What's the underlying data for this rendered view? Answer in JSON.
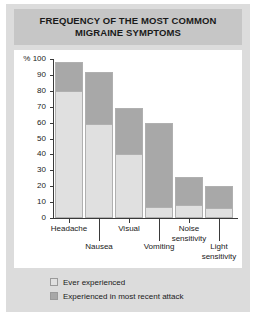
{
  "chart_data": {
    "type": "bar",
    "subtype": "stacked-bar",
    "title": "FREQUENCY OF THE MOST COMMON MIGRAINE SYMPTOMS",
    "title_lines": [
      "FREQUENCY OF THE MOST COMMON",
      "MIGRAINE SYMPTOMS"
    ],
    "xlabel": "",
    "ylabel": "%",
    "ylim": [
      0,
      100
    ],
    "yticks": [
      0,
      10,
      20,
      30,
      40,
      50,
      60,
      70,
      80,
      90,
      100
    ],
    "ytick_labels": [
      "0",
      "10",
      "20",
      "30",
      "40",
      "50",
      "60",
      "70",
      "80",
      "90",
      "100"
    ],
    "y_axis_unit_label": "%",
    "grid": false,
    "legend_position": "bottom-left",
    "categories": [
      "Headache",
      "Nausea",
      "Visual",
      "Vomiting",
      "Noise sensitivity",
      "Light sensitivity"
    ],
    "totals": [
      98,
      92,
      69,
      60,
      26,
      20
    ],
    "series": [
      {
        "name": "Ever experienced",
        "color": "#e0e0e0",
        "values": [
          80,
          59,
          40,
          7,
          8,
          6
        ]
      },
      {
        "name": "Experienced in most recent attack",
        "color": "#a8a8a8",
        "values": [
          18,
          33,
          29,
          53,
          18,
          14
        ]
      }
    ]
  },
  "colors": {
    "figure_background": "#dcdcdc",
    "title_band": "#c6c6c6",
    "plot_background": "#ffffff",
    "axis": "#3a3a3a",
    "ever_experienced": "#e0e0e0",
    "most_recent_attack": "#a8a8a8",
    "text": "#1a1a1a"
  },
  "title": {
    "line1": "FREQUENCY OF THE MOST COMMON",
    "line2": "MIGRAINE SYMPTOMS"
  },
  "axis": {
    "y_unit": "%",
    "ticks": [
      {
        "label": "100",
        "value": 100
      },
      {
        "label": "90",
        "value": 90
      },
      {
        "label": "80",
        "value": 80
      },
      {
        "label": "70",
        "value": 70
      },
      {
        "label": "60",
        "value": 60
      },
      {
        "label": "50",
        "value": 50
      },
      {
        "label": "40",
        "value": 40
      },
      {
        "label": "30",
        "value": 30
      },
      {
        "label": "20",
        "value": 20
      },
      {
        "label": "10",
        "value": 10
      },
      {
        "label": "0",
        "value": 0
      }
    ],
    "category_labels": [
      {
        "label": "Headache",
        "row": 0
      },
      {
        "label": "Nausea",
        "row": 1
      },
      {
        "label": "Visual",
        "row": 0
      },
      {
        "label": "Vomiting",
        "row": 1
      },
      {
        "label": "Noise",
        "label2": "sensitivity",
        "row": 0
      },
      {
        "label": "Light",
        "label2": "sensitivity",
        "row": 1
      }
    ]
  },
  "legend": {
    "items": [
      {
        "label": "Ever experienced",
        "color": "#e0e0e0"
      },
      {
        "label": "Experienced in most recent attack",
        "color": "#a8a8a8"
      }
    ]
  }
}
